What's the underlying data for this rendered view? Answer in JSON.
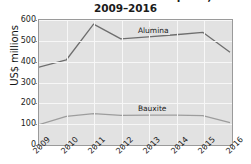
{
  "chart_data": {
    "type": "line",
    "title": "Bauxite and alumina exports,",
    "subtitle": "2009–2016",
    "xlabel": "",
    "ylabel": "US$ millions",
    "categories": [
      "2009",
      "2010",
      "2011",
      "2012",
      "2013",
      "2014",
      "2015",
      "2016"
    ],
    "ylim": [
      0,
      600
    ],
    "yticks": [
      0,
      100,
      200,
      300,
      400,
      500,
      600
    ],
    "grid": true,
    "legend_position": "inline-labels",
    "series": [
      {
        "name": "Alumina",
        "values": [
          370,
          405,
          580,
          508,
          518,
          528,
          540,
          443
        ],
        "color": "#6e6e6e",
        "label_x_index": 3.55,
        "label_y": 548
      },
      {
        "name": "Bauxite",
        "values": [
          90,
          130,
          143,
          135,
          136,
          136,
          134,
          100
        ],
        "color": "#9d9d9d",
        "label_x_index": 3.55,
        "label_y": 173
      }
    ]
  }
}
